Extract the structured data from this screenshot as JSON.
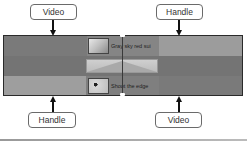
{
  "callouts": {
    "top_left": "Video",
    "top_right": "Handle",
    "bottom_left": "Handle",
    "bottom_right": "Video"
  },
  "timeline": {
    "clip_a": {
      "label": "Gray sky red sui"
    },
    "clip_b": {
      "label": "Shoot the edge"
    }
  },
  "colors": {
    "video": "#767676",
    "handle": "#9a9a9a",
    "clip": "#888888"
  }
}
